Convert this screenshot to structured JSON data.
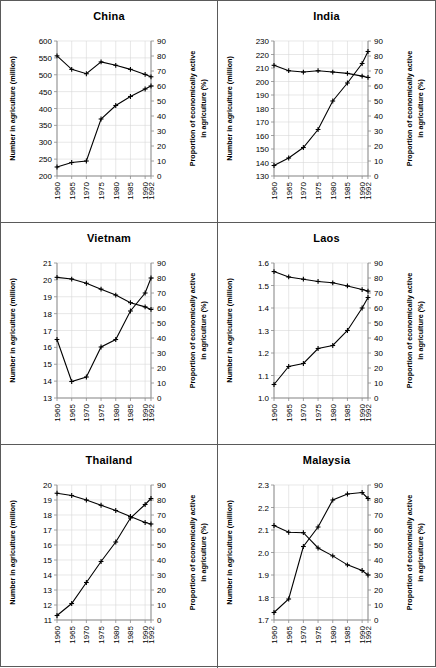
{
  "figure": {
    "name": "agriculture-labour-six-panel-figure",
    "panel_order": [
      "china",
      "india",
      "vietnam",
      "laos",
      "thailand",
      "malaysia"
    ]
  },
  "axes": {
    "xlabel": "",
    "ylabel_left": "Number in agriculture (million)",
    "ylabel_right": "Proportion of economically active in agriculture (%)",
    "xticks": [
      "1960",
      "1965",
      "1970",
      "1975",
      "1980",
      "1985",
      "1990",
      "1992"
    ],
    "right_ticks": [
      "0",
      "10",
      "20",
      "30",
      "40",
      "50",
      "60",
      "70",
      "80",
      "90"
    ],
    "right_ylim": [
      0,
      90
    ],
    "grid": true,
    "legend": "none"
  },
  "chart_data": [
    {
      "type": "line",
      "title": "China",
      "xlabel": "",
      "ylabel": "Number in agriculture (million)",
      "ylabel_right": "Proportion of economically active in agriculture (%)",
      "x": [
        1960,
        1965,
        1970,
        1975,
        1980,
        1985,
        1990,
        1992
      ],
      "yticks_left": [
        "200",
        "250",
        "300",
        "350",
        "400",
        "450",
        "500",
        "550",
        "600"
      ],
      "ylim_left": [
        200,
        600
      ],
      "ylim_right": [
        0,
        90
      ],
      "grid": true,
      "series": [
        {
          "name": "Number in agriculture (million)",
          "axis": "left",
          "values": [
            556,
            516,
            503,
            538,
            528,
            516,
            501,
            494
          ]
        },
        {
          "name": "Proportion of economically active in agriculture (%)",
          "axis": "right",
          "values": [
            6,
            9,
            10,
            38,
            47,
            53,
            58,
            60
          ]
        }
      ]
    },
    {
      "type": "line",
      "title": "India",
      "xlabel": "",
      "ylabel": "Number in agriculture (million)",
      "ylabel_right": "Proportion of economically active in agriculture (%)",
      "x": [
        1960,
        1965,
        1970,
        1975,
        1980,
        1985,
        1990,
        1992
      ],
      "yticks_left": [
        "130",
        "140",
        "150",
        "160",
        "170",
        "180",
        "190",
        "200",
        "210",
        "220",
        "230"
      ],
      "ylim_left": [
        130,
        230
      ],
      "ylim_right": [
        0,
        90
      ],
      "grid": true,
      "series": [
        {
          "name": "Number in agriculture (million)",
          "axis": "left",
          "values": [
            212,
            208,
            207,
            208,
            207,
            206,
            204,
            203
          ]
        },
        {
          "name": "Proportion of economically active in agriculture (%)",
          "axis": "right",
          "values": [
            7,
            12,
            19,
            31,
            50,
            62,
            75,
            83
          ]
        }
      ]
    },
    {
      "type": "line",
      "title": "Vietnam",
      "xlabel": "",
      "ylabel": "Number in agriculture (million)",
      "ylabel_right": "Proportion of economically active in agriculture (%)",
      "x": [
        1960,
        1965,
        1970,
        1975,
        1980,
        1985,
        1990,
        1992
      ],
      "yticks_left": [
        "13",
        "14",
        "15",
        "16",
        "17",
        "18",
        "19",
        "20",
        "21"
      ],
      "ylim_left": [
        13,
        21
      ],
      "ylim_right": [
        0,
        90
      ],
      "grid": true,
      "series": [
        {
          "name": "Number in agriculture (million)",
          "axis": "left",
          "values": [
            20.15,
            20.05,
            19.8,
            19.45,
            19.1,
            18.65,
            18.4,
            18.25
          ]
        },
        {
          "name": "Proportion of economically active in agriculture (%)",
          "axis": "right",
          "values": [
            39,
            11,
            14,
            34,
            39,
            58,
            70,
            80
          ]
        }
      ]
    },
    {
      "type": "line",
      "title": "Laos",
      "xlabel": "",
      "ylabel": "Number in agriculture (million)",
      "ylabel_right": "Proportion of economically active in agriculture (%)",
      "x": [
        1960,
        1965,
        1970,
        1975,
        1980,
        1985,
        1990,
        1992
      ],
      "yticks_left": [
        "1.0",
        "1.1",
        "1.2",
        "1.3",
        "1.4",
        "1.5",
        "1.6"
      ],
      "ylim_left": [
        1.0,
        1.6
      ],
      "ylim_right": [
        0,
        90
      ],
      "grid": true,
      "series": [
        {
          "name": "Number in agriculture (million)",
          "axis": "left",
          "values": [
            1.562,
            1.538,
            1.528,
            1.518,
            1.512,
            1.498,
            1.482,
            1.475
          ]
        },
        {
          "name": "Proportion of economically active in agriculture (%)",
          "axis": "right",
          "values": [
            9,
            21,
            23,
            33,
            35,
            45,
            60,
            67
          ]
        }
      ]
    },
    {
      "type": "line",
      "title": "Thailand",
      "xlabel": "",
      "ylabel": "Number in agriculture (million)",
      "ylabel_right": "Proportion of economically active in agriculture (%)",
      "x": [
        1960,
        1965,
        1970,
        1975,
        1980,
        1985,
        1990,
        1992
      ],
      "yticks_left": [
        "11",
        "12",
        "13",
        "14",
        "15",
        "16",
        "17",
        "18",
        "19",
        "20"
      ],
      "ylim_left": [
        11,
        20
      ],
      "ylim_right": [
        0,
        90
      ],
      "grid": true,
      "series": [
        {
          "name": "Number in agriculture (million)",
          "axis": "left",
          "values": [
            19.45,
            19.3,
            19.0,
            18.65,
            18.3,
            17.9,
            17.5,
            17.4
          ]
        },
        {
          "name": "Proportion of economically active in agriculture (%)",
          "axis": "right",
          "values": [
            3,
            11,
            25,
            39,
            52,
            68,
            77,
            81
          ]
        }
      ]
    },
    {
      "type": "line",
      "title": "Malaysia",
      "xlabel": "",
      "ylabel": "Number in agriculture (million)",
      "ylabel_right": "Proportion of economically active in agriculture (%)",
      "x": [
        1960,
        1965,
        1970,
        1975,
        1980,
        1985,
        1990,
        1992
      ],
      "yticks_left": [
        "1.7",
        "1.8",
        "1.9",
        "2.0",
        "2.1",
        "2.2",
        "2.3"
      ],
      "ylim_left": [
        1.7,
        2.3
      ],
      "ylim_right": [
        0,
        90
      ],
      "grid": true,
      "series": [
        {
          "name": "Number in agriculture (million)",
          "axis": "left",
          "values": [
            2.12,
            2.09,
            2.088,
            2.02,
            1.985,
            1.945,
            1.92,
            1.9
          ]
        },
        {
          "name": "Proportion of economically active in agriculture (%)",
          "axis": "right",
          "values": [
            5,
            14,
            49,
            62,
            80,
            84,
            85,
            81
          ]
        }
      ]
    }
  ]
}
